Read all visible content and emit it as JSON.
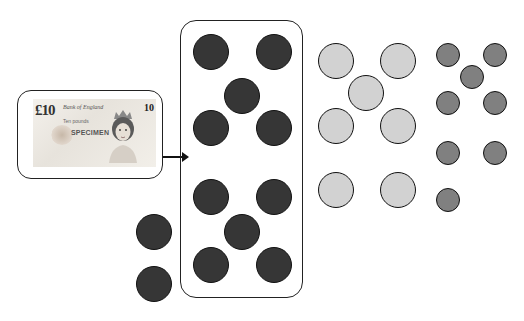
{
  "banknote": {
    "denomination": "£10",
    "denomination_corner": "10",
    "issuer_text": "Bank of England",
    "specimen_label": "SPECIMEN",
    "caption": "Ten pounds"
  },
  "arrow": {
    "direction": "right"
  },
  "groups": {
    "dark_in_box": {
      "color": "#363636",
      "count": 10,
      "circles": [
        {
          "x": 211,
          "y": 52
        },
        {
          "x": 274,
          "y": 52
        },
        {
          "x": 242,
          "y": 96
        },
        {
          "x": 211,
          "y": 128
        },
        {
          "x": 274,
          "y": 128
        },
        {
          "x": 211,
          "y": 197
        },
        {
          "x": 274,
          "y": 197
        },
        {
          "x": 242,
          "y": 232
        },
        {
          "x": 211,
          "y": 265
        },
        {
          "x": 274,
          "y": 265
        }
      ],
      "radius": 18
    },
    "dark_outside": {
      "color": "#363636",
      "count": 2,
      "circles": [
        {
          "x": 154,
          "y": 232
        },
        {
          "x": 154,
          "y": 284
        }
      ],
      "radius": 18
    },
    "light": {
      "color": "#d2d2d2",
      "count": 7,
      "circles": [
        {
          "x": 336,
          "y": 61
        },
        {
          "x": 398,
          "y": 61
        },
        {
          "x": 366,
          "y": 93
        },
        {
          "x": 336,
          "y": 126
        },
        {
          "x": 398,
          "y": 126
        },
        {
          "x": 336,
          "y": 190
        },
        {
          "x": 398,
          "y": 190
        }
      ],
      "radius": 18
    },
    "medium": {
      "color": "#808080",
      "count": 8,
      "circles": [
        {
          "x": 448,
          "y": 55
        },
        {
          "x": 495,
          "y": 55
        },
        {
          "x": 472,
          "y": 77
        },
        {
          "x": 448,
          "y": 103
        },
        {
          "x": 495,
          "y": 103
        },
        {
          "x": 448,
          "y": 153
        },
        {
          "x": 495,
          "y": 153
        },
        {
          "x": 448,
          "y": 200
        }
      ],
      "radius": 12
    }
  }
}
